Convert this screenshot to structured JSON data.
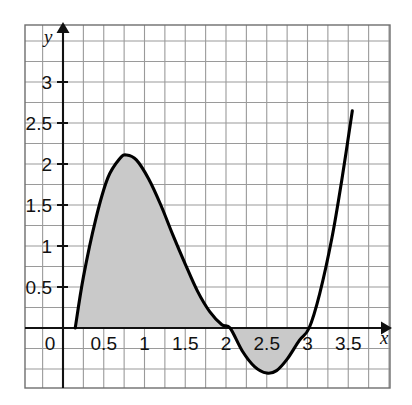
{
  "chart_data": {
    "type": "line",
    "title": "",
    "xlabel": "x",
    "ylabel": "y",
    "grid": true,
    "legend": "none",
    "xlim": [
      -0.35,
      3.9
    ],
    "ylim": [
      -1.05,
      3.45
    ],
    "x_ticks": [
      "0",
      "0.5",
      "1",
      "1.5",
      "2",
      "2.5",
      "3",
      "3.5"
    ],
    "x_tick_values": [
      0,
      0.5,
      1,
      1.5,
      2,
      2.5,
      3,
      3.5
    ],
    "y_ticks": [
      "0.5",
      "1",
      "1.5",
      "2",
      "2.5",
      "3"
    ],
    "y_tick_values": [
      0.5,
      1,
      1.5,
      2,
      2.5,
      3
    ],
    "grid_step_x": 0.25,
    "grid_step_y": 0.25,
    "series": [
      {
        "name": "curve",
        "color": "#000000",
        "x": [
          0.15,
          0.25,
          0.4,
          0.55,
          0.7,
          0.78,
          0.9,
          1.05,
          1.2,
          1.35,
          1.5,
          1.65,
          1.8,
          1.95,
          2.05,
          2.2,
          2.35,
          2.5,
          2.62,
          2.75,
          2.9,
          3.02,
          3.15,
          3.3,
          3.42,
          3.55
        ],
        "y": [
          0.0,
          0.62,
          1.32,
          1.83,
          2.07,
          2.11,
          2.05,
          1.82,
          1.5,
          1.13,
          0.78,
          0.45,
          0.2,
          0.04,
          0.0,
          -0.28,
          -0.47,
          -0.55,
          -0.52,
          -0.38,
          -0.15,
          0.0,
          0.42,
          1.1,
          1.8,
          2.65
        ]
      }
    ],
    "shaded_regions": [
      {
        "name": "area-above-axis",
        "x_from": 0.15,
        "x_to": 2.05,
        "fill": "#c9c9c9"
      },
      {
        "name": "area-below-axis",
        "x_from": 2.05,
        "x_to": 3.02,
        "fill": "#c9c9c9"
      }
    ],
    "annotations": {
      "local_max": {
        "x": 0.78,
        "y": 2.11
      },
      "local_min": {
        "x": 2.5,
        "y": -0.55
      },
      "roots": [
        0.15,
        2.05,
        3.02
      ]
    },
    "colors": {
      "curve": "#000000",
      "axis": "#111111",
      "grid": "#9a9a9a",
      "frame": "#6e6e6e",
      "shade": "#c9c9c9",
      "background": "#ffffff"
    }
  }
}
